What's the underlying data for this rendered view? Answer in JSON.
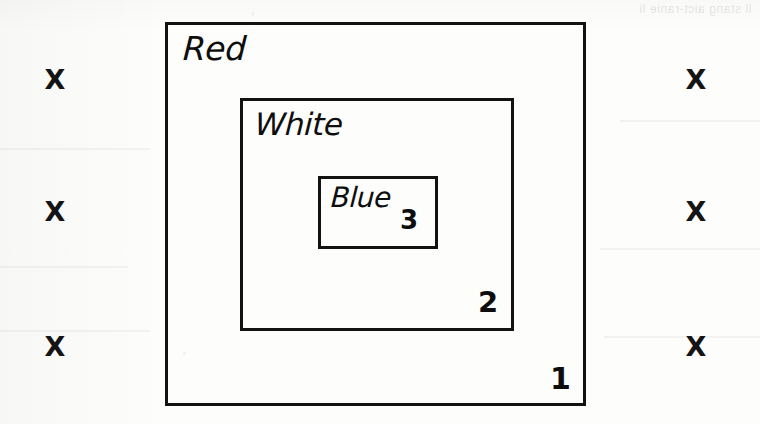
{
  "figure": {
    "kind": "nested-rectangles-diagram",
    "medium": "scanned-paper",
    "background_color": "#fdfdfc",
    "ink_color": "#121212"
  },
  "boxes": [
    {
      "id": "outer",
      "label": "Red",
      "level_number": "1",
      "level_index": 1,
      "bounds": {
        "x": 165,
        "y": 22,
        "width": 421,
        "height": 384
      },
      "label_position": "top-left",
      "number_position": "bottom-right",
      "border_width": 3,
      "border_color": "#121212"
    },
    {
      "id": "middle",
      "label": "White",
      "level_number": "2",
      "level_index": 2,
      "bounds": {
        "x": 240,
        "y": 98,
        "width": 274,
        "height": 233
      },
      "label_position": "top-left",
      "number_position": "bottom-right",
      "border_width": 3,
      "border_color": "#121212"
    },
    {
      "id": "inner",
      "label": "Blue",
      "level_number": "3",
      "level_index": 3,
      "bounds": {
        "x": 318,
        "y": 176,
        "width": 120,
        "height": 73
      },
      "label_position": "top-left",
      "number_position": "bottom-right",
      "border_width": 3,
      "border_color": "#121212"
    }
  ],
  "marks": {
    "glyph": "X",
    "icon_name": "x-mark-icon",
    "count": 6,
    "left_column": [
      {
        "glyph": "X",
        "x": 55,
        "y": 80
      },
      {
        "glyph": "X",
        "x": 55,
        "y": 212
      },
      {
        "glyph": "X",
        "x": 55,
        "y": 347
      }
    ],
    "right_column": [
      {
        "glyph": "X",
        "x": 696,
        "y": 80
      },
      {
        "glyph": "X",
        "x": 696,
        "y": 212
      },
      {
        "glyph": "X",
        "x": 696,
        "y": 347
      }
    ]
  },
  "artifacts": {
    "bleed_through_text": "ll stang aict-ranie li",
    "note": "faint mirrored show-through from reverse of scanned page, top-right corner"
  }
}
